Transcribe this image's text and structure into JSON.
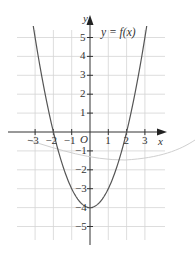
{
  "chart_data": {
    "type": "line",
    "title": "",
    "annotation": "y = f(x)",
    "xlabel": "x",
    "ylabel": "y",
    "origin_label": "O",
    "xlim": [
      -3.5,
      3.5
    ],
    "ylim": [
      -5.5,
      5.8
    ],
    "grid": true,
    "x_ticks": [
      -3,
      -2,
      -1,
      1,
      2,
      3
    ],
    "x_tick_labels": [
      "−3",
      "−2",
      "−1",
      "1",
      "2",
      "3"
    ],
    "y_ticks": [
      5,
      4,
      3,
      2,
      1,
      -1,
      -2,
      -3,
      -4,
      -5
    ],
    "y_tick_labels": [
      "5",
      "4",
      "3",
      "2",
      "1",
      "−1",
      "−2",
      "−3",
      "−4",
      "−5"
    ],
    "series": [
      {
        "name": "y = f(x)",
        "equation": "y = x^2 - 4",
        "x": [
          -3.1,
          -3,
          -2.5,
          -2,
          -1.5,
          -1,
          -0.5,
          0,
          0.5,
          1,
          1.5,
          2,
          2.5,
          3,
          3.1
        ],
        "y": [
          5.61,
          5,
          2.25,
          0,
          -1.75,
          -3,
          -3.75,
          -4,
          -3.75,
          -3,
          -1.75,
          0,
          2.25,
          5,
          5.61
        ]
      }
    ],
    "key_points": {
      "x_intercepts": [
        [
          -2,
          0
        ],
        [
          2,
          0
        ]
      ],
      "y_intercept_vertex": [
        0,
        -4
      ]
    }
  },
  "labels": {
    "annotation": "y = f(x)",
    "x_axis": "x",
    "y_axis": "y",
    "origin": "O"
  }
}
